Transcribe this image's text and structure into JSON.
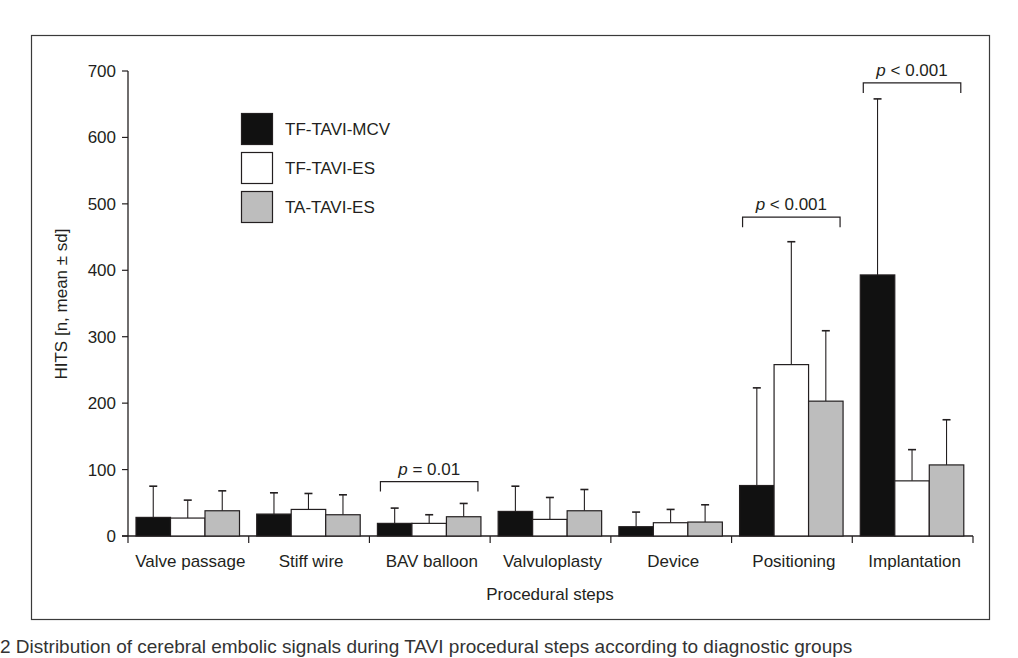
{
  "chart_data": {
    "type": "bar",
    "title": "",
    "xlabel": "Procedural steps",
    "ylabel": "HITS [n, mean ± sd]",
    "ylim": [
      0,
      700
    ],
    "yticks": [
      0,
      100,
      200,
      300,
      400,
      500,
      600,
      700
    ],
    "grid": false,
    "legend_position": "upper left (inside)",
    "categories": [
      "Valve passage",
      "Stiff wire",
      "BAV balloon",
      "Valvuloplasty",
      "Device",
      "Positioning",
      "Implantation"
    ],
    "series": [
      {
        "name": "TF-TAVI-MCV",
        "color": "#111111",
        "values": [
          28,
          33,
          19,
          37,
          14,
          76,
          393
        ],
        "error_upper": [
          75,
          65,
          42,
          75,
          36,
          223,
          658
        ]
      },
      {
        "name": "TF-TAVI-ES",
        "color": "#ffffff",
        "values": [
          27,
          40,
          19,
          25,
          20,
          258,
          83
        ],
        "error_upper": [
          54,
          64,
          32,
          58,
          40,
          443,
          130
        ]
      },
      {
        "name": "TA-TAVI-ES",
        "color": "#bdbdbd",
        "values": [
          38,
          32,
          29,
          38,
          21,
          203,
          107
        ],
        "error_upper": [
          68,
          62,
          49,
          70,
          47,
          309,
          175
        ]
      }
    ],
    "annotations": [
      {
        "category": "BAV balloon",
        "text_p": "p",
        "text_rest": " = 0.01",
        "bracket_y": 82
      },
      {
        "category": "Positioning",
        "text_p": "p",
        "text_rest": " < 0.001",
        "bracket_y": 480
      },
      {
        "category": "Implantation",
        "text_p": "p",
        "text_rest": " < 0.001",
        "bracket_y": 682
      }
    ]
  },
  "caption": "2   Distribution of cerebral embolic signals during TAVI procedural steps according to diagnostic groups"
}
